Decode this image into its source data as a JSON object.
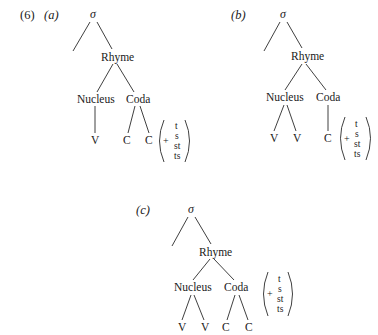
{
  "example_number": "(6)",
  "trees": [
    {
      "label": "(a)",
      "root": "σ",
      "rhyme": "Rhyme",
      "nucleus": "Nucleus",
      "coda": "Coda",
      "nucleus_children": [
        "V"
      ],
      "coda_children": [
        "C",
        "C"
      ],
      "appendix": {
        "plus": "+",
        "options": [
          "t",
          "s",
          "st",
          "ts"
        ]
      }
    },
    {
      "label": "(b)",
      "root": "σ",
      "rhyme": "Rhyme",
      "nucleus": "Nucleus",
      "coda": "Coda",
      "nucleus_children": [
        "V",
        "V"
      ],
      "coda_children": [
        "C"
      ],
      "appendix": {
        "plus": "+",
        "options": [
          "t",
          "s",
          "st",
          "ts"
        ]
      }
    },
    {
      "label": "(c)",
      "root": "σ",
      "rhyme": "Rhyme",
      "nucleus": "Nucleus",
      "coda": "Coda",
      "nucleus_children": [
        "V",
        "V"
      ],
      "coda_children": [
        "C",
        "C"
      ],
      "appendix": {
        "plus": "+",
        "options": [
          "t",
          "s",
          "st",
          "ts"
        ]
      }
    }
  ]
}
